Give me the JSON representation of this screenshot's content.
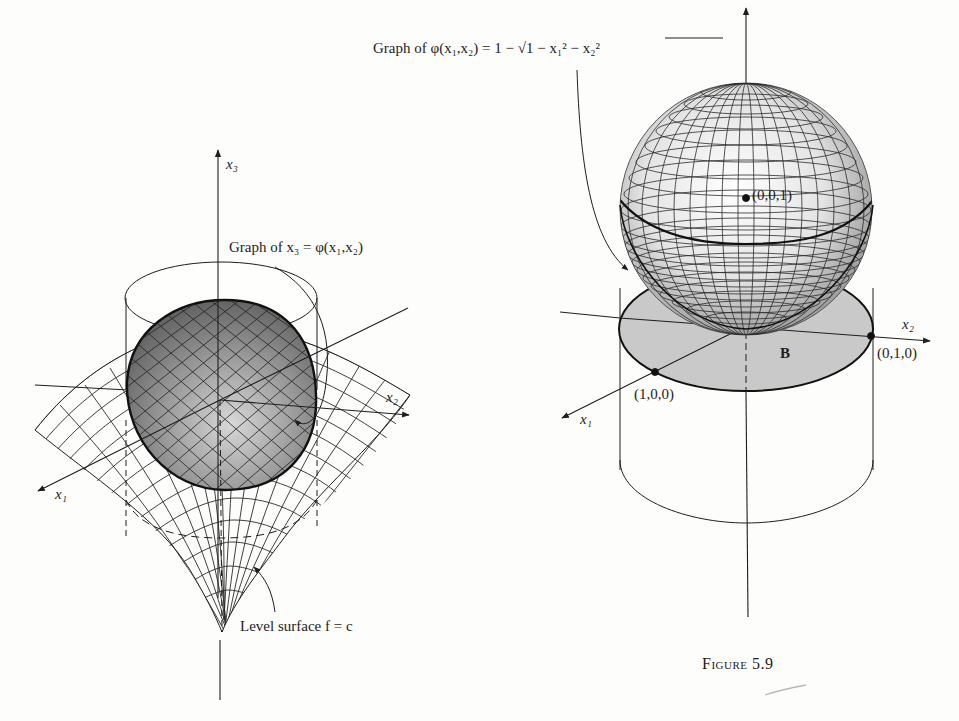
{
  "figure": {
    "caption": "Figure 5.9",
    "left_panel": {
      "axis_labels": {
        "x1": "x₁",
        "x2": "x₂",
        "x3": "x₃"
      },
      "graph_label": "Graph of x₃ = φ(x₁,x₂)",
      "level_surface_label": "Level surface f = c"
    },
    "right_panel": {
      "graph_label": "Graph of φ(x₁,x₂) = 1 − √(1 − x₁² − x₂²)",
      "graph_label_prefix": "Graph of φ(x₁,x₂) = 1 − ",
      "graph_label_radicand": "1 − x₁² − x₂²",
      "axis_labels": {
        "x1": "x₁",
        "x2": "x₂"
      },
      "points": [
        {
          "label": "(0,0,1)",
          "role": "sphere-center"
        },
        {
          "label": "(1,0,0)",
          "role": "x1-intercept"
        },
        {
          "label": "(0,1,0)",
          "role": "x2-intercept"
        }
      ],
      "region_label": "B"
    },
    "colors": {
      "ink": "#1e1e1e",
      "paper": "#fdfdfc",
      "region_fill": "#c9c9c9",
      "shaded_cap": "#8a8a8a"
    }
  }
}
